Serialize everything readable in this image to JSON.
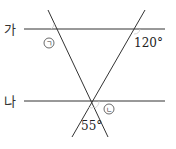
{
  "diagram": {
    "lines": {
      "line_ga": {
        "label": "가"
      },
      "line_na": {
        "label": "나"
      }
    },
    "angles": {
      "angle_a": {
        "label": "㉠",
        "symbol": "ㄱ"
      },
      "angle_b": {
        "label": "㉡",
        "symbol": "ㄴ"
      },
      "angle_120": {
        "label": "120°"
      },
      "angle_55": {
        "label": "55°"
      }
    },
    "colors": {
      "line": "#333333",
      "text": "#222222",
      "arc": "#bbbbbb"
    }
  }
}
